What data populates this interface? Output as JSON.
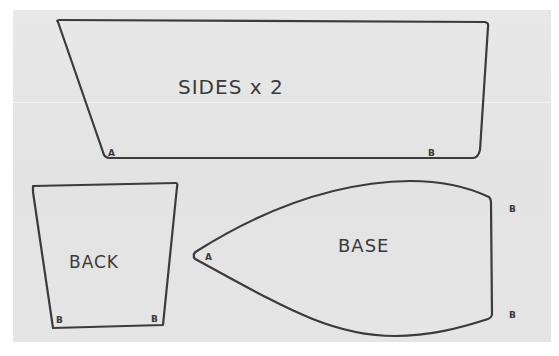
{
  "diagram": {
    "type": "sewing-pattern-sketch",
    "pieces": [
      {
        "id": "sides",
        "label": "SIDES x 2",
        "corners": [
          {
            "label": "A"
          },
          {
            "label": "B"
          }
        ]
      },
      {
        "id": "back",
        "label": "BACK",
        "corners": [
          {
            "label": "B"
          },
          {
            "label": "B"
          }
        ]
      },
      {
        "id": "base",
        "label": "BASE",
        "corners": [
          {
            "label": "A"
          },
          {
            "label": "B"
          },
          {
            "label": "B"
          }
        ]
      }
    ]
  },
  "colors": {
    "paper": "#e4e4e4",
    "ink": "#3b3b3b",
    "background": "#ffffff"
  }
}
